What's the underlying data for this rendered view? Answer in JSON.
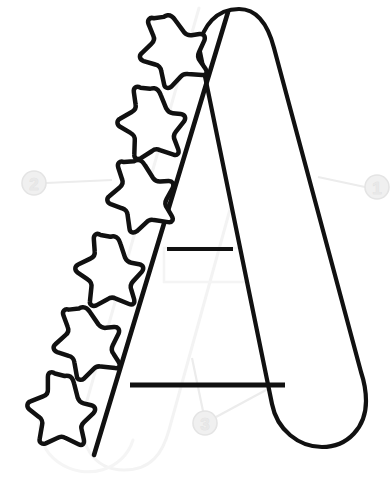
{
  "page": {
    "background_color": "#ffffff",
    "width": 392,
    "height": 481
  },
  "artwork": {
    "name": "uppercase-letter-a-outline-with-stars",
    "description": "Uppercase outline letter A with six rounded stars arranged along the left diagonal stroke",
    "stroke_color": "#111111",
    "fill_color": "#ffffff",
    "ghost_color": "#f4f4f4",
    "letter": {
      "glyph": "A",
      "left_stroke_label": "left-diagonal-stroke",
      "right_stroke_label": "right-diagonal-stroke",
      "upper_crossbar_label": "upper-crossbar",
      "lower_crossbar_label": "lower-crossbar",
      "apex_label": "rounded-apex",
      "foot_label": "rounded-foot"
    },
    "stars": [
      {
        "id": "star-1",
        "cx": 172,
        "cy": 47,
        "r_outer": 33,
        "r_inner": 16,
        "rotation": -8
      },
      {
        "id": "star-2",
        "cx": 151,
        "cy": 120,
        "r_outer": 33,
        "r_inner": 16,
        "rotation": 6
      },
      {
        "id": "star-3",
        "cx": 140,
        "cy": 192,
        "r_outer": 33,
        "r_inner": 16,
        "rotation": -4
      },
      {
        "id": "star-4",
        "cx": 109,
        "cy": 268,
        "r_outer": 33,
        "r_inner": 16,
        "rotation": 10
      },
      {
        "id": "star-5",
        "cx": 86,
        "cy": 339,
        "r_outer": 33,
        "r_inner": 16,
        "rotation": -6
      },
      {
        "id": "star-6",
        "cx": 61,
        "cy": 407,
        "r_outer": 33,
        "r_inner": 16,
        "rotation": 14
      }
    ]
  },
  "callouts": {
    "color": "#ebebeb",
    "leader_color": "#ededed",
    "items": [
      {
        "id": "callout-1",
        "label": "1",
        "cx": 377,
        "cy": 187,
        "r": 12,
        "leader": [
          {
            "x": 365,
            "y": 187
          },
          {
            "x": 318,
            "y": 177
          }
        ]
      },
      {
        "id": "callout-2",
        "label": "2",
        "cx": 34,
        "cy": 183,
        "r": 12,
        "leader": [
          {
            "x": 46,
            "y": 183
          },
          {
            "x": 112,
            "y": 180
          }
        ]
      },
      {
        "id": "callout-3",
        "label": "3",
        "cx": 205,
        "cy": 423,
        "r": 12,
        "leader_a": [
          {
            "x": 203,
            "y": 411
          },
          {
            "x": 192,
            "y": 358
          }
        ],
        "leader_b": [
          {
            "x": 216,
            "y": 417
          },
          {
            "x": 292,
            "y": 376
          }
        ]
      }
    ]
  }
}
